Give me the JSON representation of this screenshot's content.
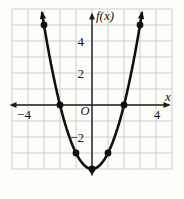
{
  "figure": {
    "background": "#fdfdfa",
    "grid_color": "#c7c7c7",
    "axis_color": "#1c1c1c",
    "curve_color": "#101010",
    "point_color": "#101010",
    "text_color": "#141414"
  },
  "chart_data": {
    "type": "line",
    "title": "",
    "xlabel": "x",
    "ylabel": "f(x)",
    "origin_label": "O",
    "xlim": [
      -5,
      5
    ],
    "ylim": [
      -4,
      6
    ],
    "grid": true,
    "legend": "none",
    "curve": "upward parabola with vertex (0,-4), arrows on both ends and on both axes",
    "x": [
      -3,
      -2,
      -1,
      0,
      1,
      2,
      3
    ],
    "y": [
      5,
      0,
      -3,
      -4,
      -3,
      0,
      5
    ],
    "marked_points": [
      [
        -3,
        5
      ],
      [
        -2,
        0
      ],
      [
        -1,
        -3
      ],
      [
        0,
        -4
      ],
      [
        1,
        -3
      ],
      [
        2,
        0
      ],
      [
        3,
        5
      ]
    ],
    "vertex": [
      0,
      -4
    ],
    "x_tick_labels": [
      {
        "value": -4,
        "label": "−4"
      },
      {
        "value": 4,
        "label": "4"
      }
    ],
    "y_tick_labels": [
      {
        "value": 4,
        "label": "4"
      },
      {
        "value": 2,
        "label": "2"
      },
      {
        "value": -2,
        "label": "−2"
      }
    ]
  }
}
